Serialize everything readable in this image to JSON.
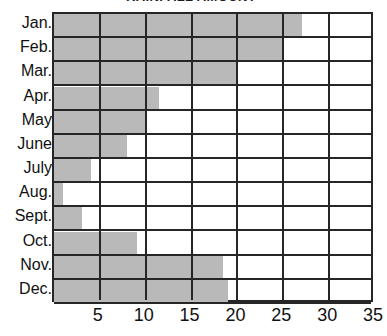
{
  "chart_data": {
    "type": "bar",
    "orientation": "horizontal",
    "title": "RAINFALL AMOUNT",
    "xlabel": "",
    "ylabel": "",
    "categories": [
      "Jan.",
      "Feb.",
      "Mar.",
      "Apr.",
      "May",
      "June",
      "July",
      "Aug.",
      "Sept.",
      "Oct.",
      "Nov.",
      "Dec."
    ],
    "values": [
      27,
      25,
      20,
      11.5,
      10,
      8,
      4,
      1,
      3,
      9,
      18.4,
      19
    ],
    "xlim": [
      0,
      35
    ],
    "xticks": [
      5,
      10,
      15,
      20,
      25,
      30,
      35
    ],
    "xticklabels": [
      "5",
      "10",
      "15",
      "20",
      "25",
      "30",
      "35"
    ],
    "grid": "vertical",
    "legend": "none",
    "bar_color": "#b9b9b9",
    "line_color": "#262626"
  }
}
